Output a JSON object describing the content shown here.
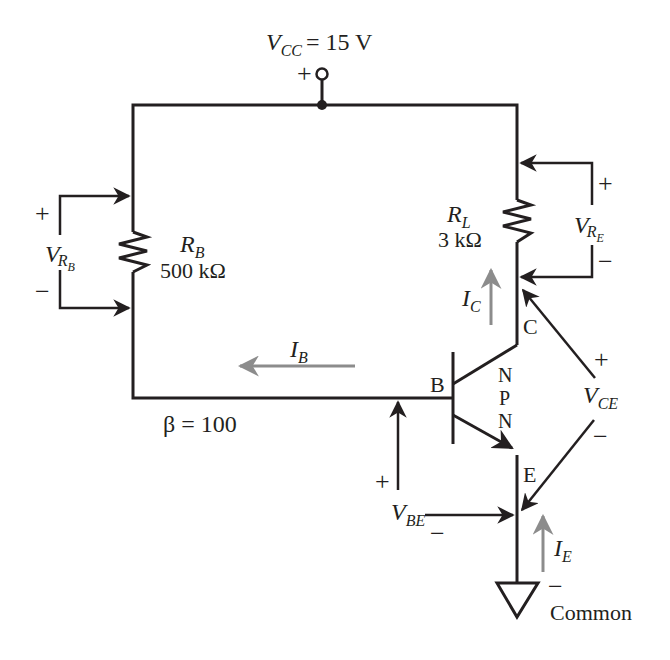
{
  "diagram": {
    "type": "circuit-schematic",
    "colors": {
      "wire": "#231f20",
      "current_arrow": "#8c8c8c",
      "background": "#ffffff"
    },
    "supply": {
      "symbol": "V",
      "subscript": "CC",
      "value": "= 15 V",
      "polarity": "+"
    },
    "base_resistor": {
      "symbol": "R",
      "subscript": "B",
      "value": "500 kΩ"
    },
    "load_resistor": {
      "symbol": "R",
      "subscript": "L",
      "value": "3 kΩ"
    },
    "voltage_rb": {
      "symbol": "V",
      "subscript": "R",
      "subsubscript": "B",
      "plus": "+",
      "minus": "−"
    },
    "voltage_re": {
      "symbol": "V",
      "subscript": "R",
      "subsubscript": "E",
      "plus": "+",
      "minus": "−"
    },
    "voltage_ce": {
      "symbol": "V",
      "subscript": "CE",
      "plus": "+",
      "minus": "−"
    },
    "voltage_be": {
      "symbol": "V",
      "subscript": "BE",
      "plus": "+",
      "minus": "−"
    },
    "currents": {
      "ib": {
        "symbol": "I",
        "subscript": "B"
      },
      "ic": {
        "symbol": "I",
        "subscript": "C"
      },
      "ie": {
        "symbol": "I",
        "subscript": "E"
      }
    },
    "transistor": {
      "type_letters": [
        "N",
        "P",
        "N"
      ],
      "base_label": "B",
      "collector_label": "C",
      "emitter_label": "E"
    },
    "beta": "β = 100",
    "ground": {
      "label": "Common",
      "polarity": "−"
    }
  }
}
